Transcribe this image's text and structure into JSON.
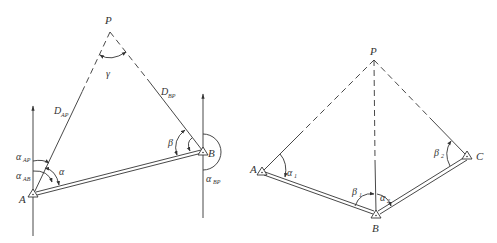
{
  "figures": [
    {
      "id": "left",
      "description": "Forward intersection with azimuths and distances",
      "points": {
        "P": {
          "label": "P"
        },
        "A": {
          "label": "A"
        },
        "B": {
          "label": "B"
        }
      },
      "labels": {
        "D_AP": {
          "main": "D",
          "sub": "AP"
        },
        "D_BP": {
          "main": "D",
          "sub": "BP"
        },
        "gamma": {
          "main": "γ"
        },
        "alpha": {
          "main": "α"
        },
        "beta": {
          "main": "β"
        },
        "alpha_AP": {
          "main": "α",
          "sub": "AP"
        },
        "alpha_AB": {
          "main": "α",
          "sub": "AB"
        },
        "alpha_BP": {
          "main": "α",
          "sub": "BP"
        }
      }
    },
    {
      "id": "right",
      "description": "Intersection from three known points",
      "points": {
        "P": {
          "label": "P"
        },
        "A": {
          "label": "A"
        },
        "B": {
          "label": "B"
        },
        "C": {
          "label": "C"
        }
      },
      "labels": {
        "alpha1": {
          "main": "α",
          "sub": "1"
        },
        "alpha2": {
          "main": "α",
          "sub": "2"
        },
        "beta1": {
          "main": "β",
          "sub": "1"
        },
        "beta2": {
          "main": "β",
          "sub": "2"
        }
      }
    }
  ],
  "colors": {
    "line": "#333333",
    "background": "#ffffff"
  }
}
